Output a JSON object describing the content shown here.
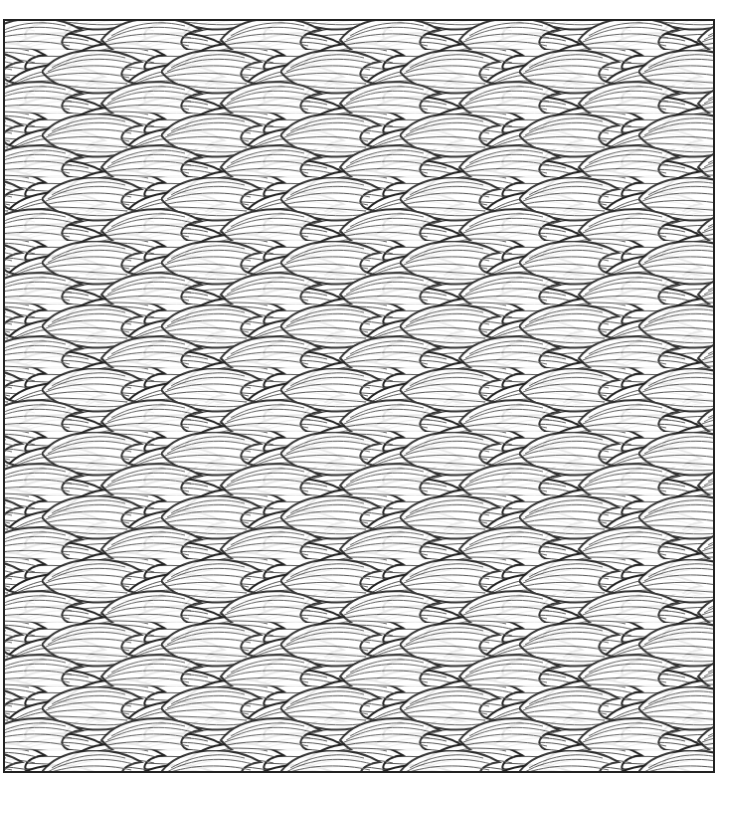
{
  "artwork": {
    "type": "coloring-page",
    "subject": "overlapping leaf pattern",
    "frame": {
      "x": 3,
      "y": 19,
      "width": 712,
      "height": 754
    },
    "colors": {
      "background": "#ffffff",
      "line": "#222222",
      "hatch": "#555555"
    }
  }
}
